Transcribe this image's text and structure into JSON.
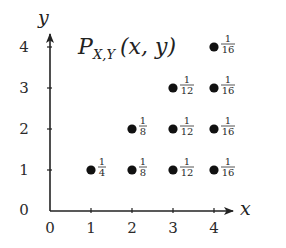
{
  "chart_data": {
    "type": "scatter",
    "title_parts": {
      "main": "P",
      "sub": "X,Y",
      "args": "(x, y)"
    },
    "xlabel": "x",
    "ylabel": "y",
    "x_ticks": [
      "0",
      "1",
      "2",
      "3",
      "4"
    ],
    "y_ticks": [
      "0",
      "1",
      "2",
      "3",
      "4"
    ],
    "xlim": [
      0,
      4
    ],
    "ylim": [
      0,
      4
    ],
    "grid": false,
    "legend": null,
    "points": [
      {
        "x": 1,
        "y": 1,
        "p": 0.25,
        "label": "1/4",
        "num": "1",
        "den": "4"
      },
      {
        "x": 2,
        "y": 1,
        "p": 0.125,
        "label": "1/8",
        "num": "1",
        "den": "8"
      },
      {
        "x": 2,
        "y": 2,
        "p": 0.125,
        "label": "1/8",
        "num": "1",
        "den": "8"
      },
      {
        "x": 3,
        "y": 1,
        "p": 0.0833,
        "label": "1/12",
        "num": "1",
        "den": "12"
      },
      {
        "x": 3,
        "y": 2,
        "p": 0.0833,
        "label": "1/12",
        "num": "1",
        "den": "12"
      },
      {
        "x": 3,
        "y": 3,
        "p": 0.0833,
        "label": "1/12",
        "num": "1",
        "den": "12"
      },
      {
        "x": 4,
        "y": 1,
        "p": 0.0625,
        "label": "1/16",
        "num": "1",
        "den": "16"
      },
      {
        "x": 4,
        "y": 2,
        "p": 0.0625,
        "label": "1/16",
        "num": "1",
        "den": "16"
      },
      {
        "x": 4,
        "y": 3,
        "p": 0.0625,
        "label": "1/16",
        "num": "1",
        "den": "16"
      },
      {
        "x": 4,
        "y": 4,
        "p": 0.0625,
        "label": "1/16",
        "num": "1",
        "den": "16"
      }
    ],
    "colors": {
      "axis": "#222222",
      "point": "#111111",
      "text": "#2a2a2a"
    }
  }
}
